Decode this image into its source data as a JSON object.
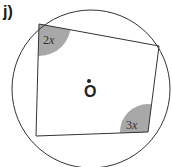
{
  "question_label": "j)",
  "diagram": {
    "center_label": "O",
    "angles": [
      {
        "coef": "2",
        "var": "x"
      },
      {
        "coef": "3",
        "var": "x"
      }
    ],
    "colors": {
      "line": "#333333",
      "angle_fill": "#a8a8a8"
    }
  }
}
